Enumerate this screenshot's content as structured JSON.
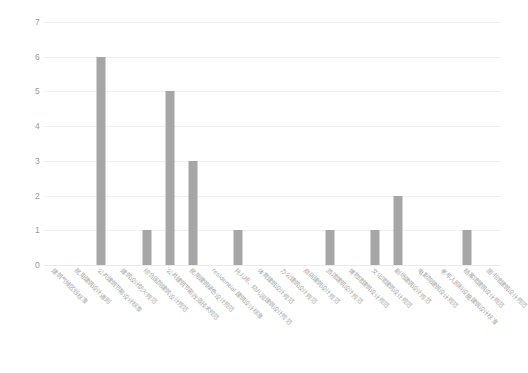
{
  "chart_data": {
    "type": "bar",
    "title": "",
    "subtitle": "",
    "xlabel": "",
    "ylabel": "",
    "ylim": [
      0,
      7
    ],
    "y_ticks": [
      0,
      1,
      2,
      3,
      4,
      5,
      6,
      7
    ],
    "grid": true,
    "legend": "none",
    "bar_color": "#a6a6a6",
    "gridline_color": "#f0f0f0",
    "tick_label_color": "#9a9a9a",
    "axis_label_color": "#a8a8a8",
    "x_label_rotation_deg": 45,
    "categories": [
      "建筑气候区划标准",
      "民用建筑设计通则",
      "公共建筑节能设计标准",
      "建筑设计防火规范",
      "综合医院建筑设计规范",
      "公共建筑节能改造技术规范",
      "民用建筑绿色设计规范",
      "residential 建筑设计标准",
      "托儿所、幼儿园建筑设计规范",
      "体育建筑设计规范",
      "办公建筑设计规范",
      "商店建筑设计规范",
      "旅馆建筑设计规范",
      "博物馆建筑设计规范",
      "文化馆建筑设计规范",
      "剧场建筑设计规范",
      "电影院建筑设计规范",
      "老年人照料设施建筑设计标准",
      "档案馆建筑设计规范",
      "图书馆建筑设计规范"
    ],
    "values": [
      0,
      0,
      6,
      0,
      1,
      5,
      3,
      0,
      1,
      0,
      0,
      0,
      1,
      0,
      1,
      2,
      0,
      0,
      1,
      0
    ]
  }
}
